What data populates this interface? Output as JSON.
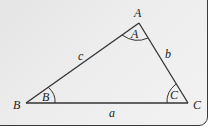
{
  "diagram": {
    "type": "triangle",
    "vertices": [
      {
        "id": "A",
        "label": "A",
        "x": 139,
        "y": 23
      },
      {
        "id": "B",
        "label": "B",
        "x": 26,
        "y": 103
      },
      {
        "id": "C",
        "label": "C",
        "x": 188,
        "y": 103
      }
    ],
    "sides": [
      {
        "id": "a",
        "label": "a",
        "from": "B",
        "to": "C"
      },
      {
        "id": "b",
        "label": "b",
        "from": "A",
        "to": "C"
      },
      {
        "id": "c",
        "label": "c",
        "from": "A",
        "to": "B"
      }
    ],
    "angles": [
      {
        "id": "A",
        "label": "A"
      },
      {
        "id": "B",
        "label": "B"
      },
      {
        "id": "C",
        "label": "C"
      }
    ],
    "colors": {
      "line": "#333333",
      "panel_bg": "#ebebeb",
      "panel_border": "#3a3a3a"
    }
  }
}
